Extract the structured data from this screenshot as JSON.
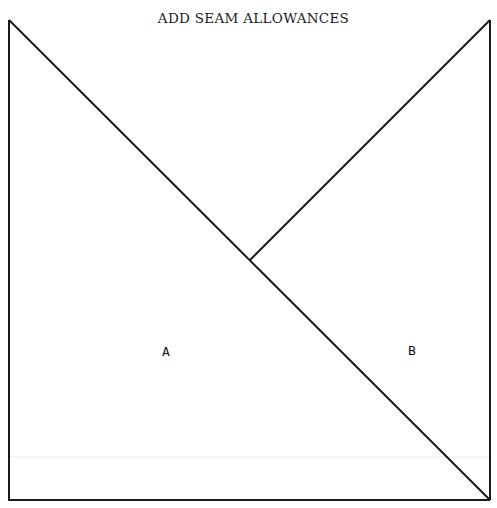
{
  "title": "ADD SEAM ALLOWANCES",
  "pieces": [
    {
      "label": "A",
      "shape": "triangle"
    },
    {
      "label": "B",
      "shape": "triangle"
    }
  ],
  "colors": {
    "line": "#1a1a1a",
    "faint_line": "#e6e6e6",
    "background": "#ffffff"
  }
}
